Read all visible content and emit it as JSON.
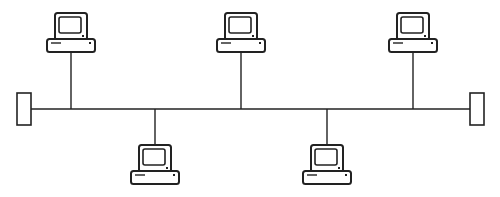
{
  "diagram": {
    "type": "bus-topology",
    "stroke_color": "#222222",
    "background": "#ffffff",
    "bus": {
      "y": 109,
      "x1": 31,
      "x2": 470
    },
    "terminators": [
      {
        "id": "terminator-left",
        "x": 17,
        "y": 93,
        "w": 14,
        "h": 32
      },
      {
        "id": "terminator-right",
        "x": 470,
        "y": 93,
        "w": 14,
        "h": 32
      }
    ],
    "nodes": [
      {
        "id": "computer-top-1",
        "position": "above",
        "cx": 71
      },
      {
        "id": "computer-top-2",
        "position": "above",
        "cx": 241
      },
      {
        "id": "computer-top-3",
        "position": "above",
        "cx": 413
      },
      {
        "id": "computer-bottom-1",
        "position": "below",
        "cx": 155
      },
      {
        "id": "computer-bottom-2",
        "position": "below",
        "cx": 327
      }
    ]
  }
}
